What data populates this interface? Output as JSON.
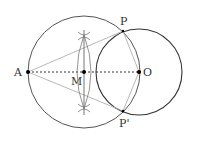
{
  "diagram": {
    "labels": {
      "A": "A",
      "M": "M",
      "O": "O",
      "P": "P",
      "P_prime": "P'"
    },
    "points": {
      "A": [
        28,
        72
      ],
      "M": [
        84,
        72
      ],
      "O": [
        139,
        72
      ],
      "P": [
        123,
        31
      ],
      "P_prime": [
        123,
        111
      ]
    },
    "circles": [
      {
        "name": "circle-centered-M",
        "center": "M",
        "radius": 56
      },
      {
        "name": "circle-centered-O",
        "center": "O",
        "radius": 43
      }
    ],
    "colors": {
      "circle_stroke": "#444444",
      "tangent_stroke": "#aaaaaa",
      "construction_stroke": "#666666",
      "point_fill": "#000000"
    }
  }
}
